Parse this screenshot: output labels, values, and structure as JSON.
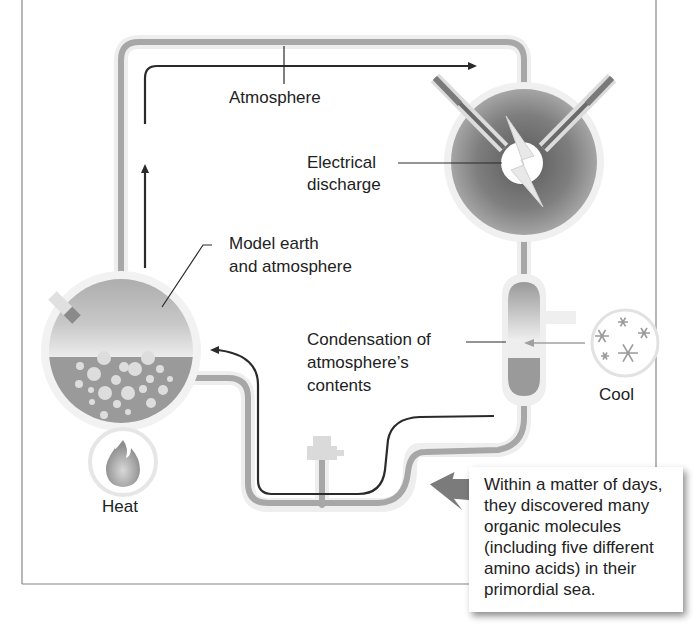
{
  "diagram": {
    "colors": {
      "tube": "#a7a7a7",
      "tube_glow": "#ececec",
      "flow_arrow": "#2a2a2a",
      "liquid": "#9a9a9a",
      "bubble": "#dddddd",
      "chamber_dark": "#6e6e6e",
      "border": "#888888"
    },
    "labels": {
      "atmosphere": "Atmosphere",
      "electrical_discharge": [
        "Electrical",
        "discharge"
      ],
      "model_earth": [
        "Model earth",
        "and atmosphere"
      ],
      "condensation": [
        "Condensation of",
        "atmosphere’s",
        "contents"
      ],
      "cool": "Cool",
      "heat": "Heat"
    },
    "icons": {
      "heat": "flame-icon",
      "cool": "snowflake-icon",
      "discharge": "lightning-bolt-icon"
    },
    "callout": {
      "lines": [
        "Within a matter of days,",
        "they discovered many",
        "organic molecules",
        "(including five different",
        "amino acids) in their",
        "primordial sea."
      ]
    }
  }
}
